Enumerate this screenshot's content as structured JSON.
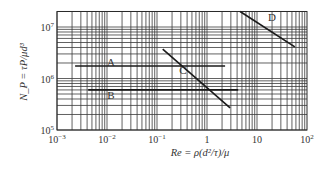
{
  "chart_data": {
    "type": "line",
    "title": "",
    "xlabel": "Re = ρ(d²/τ)/μ",
    "ylabel": "N_P = τP/μd³",
    "xscale": "log",
    "yscale": "log",
    "xlim": [
      0.001,
      100
    ],
    "ylim": [
      100000,
      20000000
    ],
    "grid": true,
    "legend": "inline labels",
    "x_ticks": [
      {
        "value": 0.001,
        "base": "10",
        "exp": "−3"
      },
      {
        "value": 0.01,
        "base": "10",
        "exp": "−2"
      },
      {
        "value": 0.1,
        "base": "10",
        "exp": "−1"
      },
      {
        "value": 1,
        "base": "1",
        "exp": ""
      },
      {
        "value": 10,
        "base": "10",
        "exp": ""
      },
      {
        "value": 100,
        "base": "10",
        "exp": "2"
      }
    ],
    "y_ticks": [
      {
        "value": 100000,
        "base": "10",
        "exp": "5"
      },
      {
        "value": 1000000,
        "base": "10",
        "exp": "6"
      },
      {
        "value": 10000000,
        "base": "10",
        "exp": "7"
      }
    ],
    "series": [
      {
        "name": "A",
        "x": [
          0.0023,
          2.3
        ],
        "y": [
          1750000,
          1750000
        ],
        "label_pos": {
          "x": 0.012,
          "y": 2100000
        }
      },
      {
        "name": "B",
        "x": [
          0.0042,
          4.2
        ],
        "y": [
          600000,
          600000
        ],
        "label_pos": {
          "x": 0.012,
          "y": 480000
        }
      },
      {
        "name": "C",
        "x": [
          0.13,
          2.9
        ],
        "y": [
          3700000,
          270000
        ],
        "label_pos": {
          "x": 0.33,
          "y": 1450000
        }
      },
      {
        "name": "D",
        "x": [
          4.6,
          57
        ],
        "y": [
          20000000,
          4100000
        ],
        "label_pos": {
          "x": 20,
          "y": 15500000
        }
      }
    ]
  }
}
